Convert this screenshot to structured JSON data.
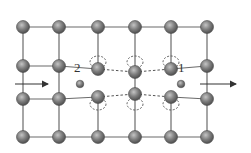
{
  "diagram": {
    "type": "crystal-lattice-dislocation",
    "colors": {
      "bond": "#6b6b6b",
      "atom_fill": "#7a7a7a",
      "atom_highlight": "#bdbdbd",
      "atom_edge": "#4a4a4a",
      "dashed": "#555555",
      "arrow": "#333333"
    },
    "columns_x": [
      23,
      59,
      98,
      135,
      171,
      207
    ],
    "rows_y": [
      27,
      66,
      99,
      137
    ],
    "labels": [
      {
        "id": "interstitial-2",
        "text": "2",
        "x": 77,
        "y": 68
      },
      {
        "id": "interstitial-1",
        "text": "1",
        "x": 179,
        "y": 68
      }
    ],
    "interstitials": [
      {
        "id": "2",
        "x": 80,
        "y": 84
      },
      {
        "id": "1",
        "x": 181,
        "y": 84
      }
    ],
    "arrows": [
      {
        "id": "left-arrow",
        "x1": 15,
        "x2": 48,
        "y": 84
      },
      {
        "id": "right-arrow",
        "x1": 200,
        "x2": 236,
        "y": 84
      }
    ]
  }
}
